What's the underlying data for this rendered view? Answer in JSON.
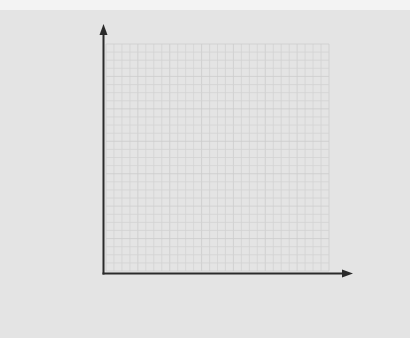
{
  "diagram": {
    "type": "blank-coordinate-grid",
    "grid": {
      "columns": 28,
      "rows": 28
    },
    "axes": {
      "x_label": "",
      "y_label": ""
    },
    "colors": {
      "background": "#e4e4e4",
      "top_strip": "#f3f3f3",
      "grid_line": "#d3d3d3",
      "grid_major_line": "#cdcdcd",
      "axis": "#2a2a2a"
    }
  }
}
